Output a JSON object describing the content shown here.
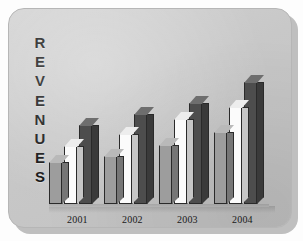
{
  "card": {
    "background_color": "#c8c8c8",
    "border_color": "#b6b6b6",
    "shadow_color": "#8e8e8e"
  },
  "axis_title": {
    "text": "REVENUES",
    "orientation": "vertical-stacked",
    "letters": [
      "R",
      "E",
      "V",
      "E",
      "N",
      "U",
      "E",
      "S"
    ]
  },
  "chart_data": {
    "type": "bar",
    "title": "",
    "subtitle": "",
    "xlabel": "",
    "ylabel": "REVENUES",
    "grid": false,
    "legend": "none",
    "axis_values_shown": false,
    "categories": [
      "2001",
      "2002",
      "2003",
      "2004"
    ],
    "series": [
      {
        "name": "series-1",
        "color": "#9d9d9d",
        "style": "light-gray",
        "values": [
          42,
          48,
          59,
          72
        ]
      },
      {
        "name": "series-2",
        "color": "#fbfbfb",
        "style": "white",
        "values": [
          58,
          70,
          85,
          97
        ]
      },
      {
        "name": "series-3",
        "color": "#4d4d4d",
        "style": "dark-gray",
        "values": [
          79,
          90,
          101,
          122
        ]
      }
    ],
    "ylim": [
      0,
      130
    ],
    "units": "relative",
    "note": "Bar heights read off pixel extents; no numeric y-axis is printed on the chart."
  },
  "labels": {
    "year_2001": "2001",
    "year_2002": "2002",
    "year_2003": "2003",
    "year_2004": "2004"
  }
}
